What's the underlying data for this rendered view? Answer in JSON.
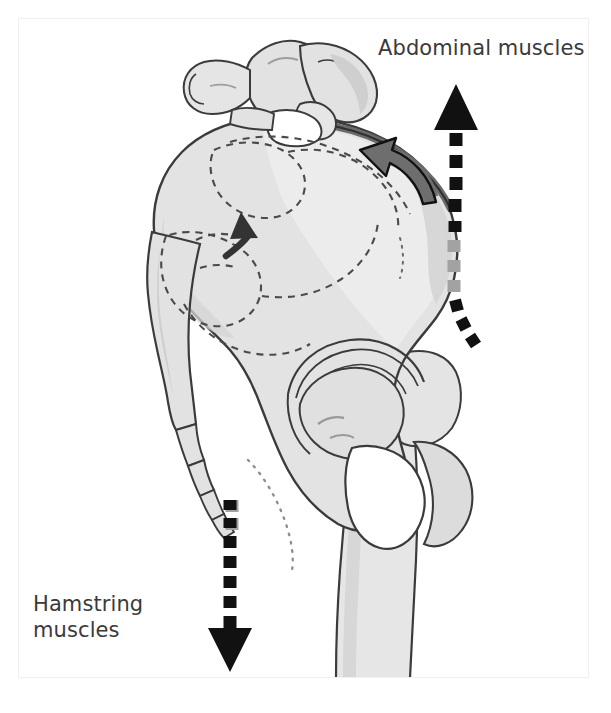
{
  "figure": {
    "background_color": "#ffffff",
    "frame_border_color": "#f0f0f0"
  },
  "labels": {
    "abdominal": "Abdominal muscles",
    "hamstring": "Hamstring\nmuscles"
  },
  "colors": {
    "text": "#3a3a3a",
    "bone_fill": "#e2e2e2",
    "bone_fill_light": "#eaeaea",
    "bone_shadow": "#cdcdcd",
    "bone_outline": "#3b3b3b",
    "dashed_outline": "#4a4a4a",
    "arrow_black": "#111111",
    "arrow_gray": "#9b9b9b",
    "curved_arrow_fill": "#6e6e6e",
    "ligament_band": "#6a6a6a",
    "white": "#ffffff"
  },
  "anatomy": {
    "parts": [
      "lumbar-vertebra",
      "sacrum",
      "coccyx",
      "ilium",
      "iliac-crest",
      "acetabulum",
      "obturator-foramen",
      "ischium",
      "pubis",
      "femoral-head",
      "greater-trochanter",
      "femur-shaft"
    ]
  },
  "arrows": {
    "abdominal_pull": {
      "name": "abdominal-muscle-force-arrow",
      "direction": "up",
      "style": "dashed",
      "head": "solid-triangle",
      "color": "#111111"
    },
    "hamstring_pull": {
      "name": "hamstring-muscle-force-arrow",
      "direction": "down",
      "style": "dashed",
      "head": "solid-triangle",
      "color": "#111111"
    },
    "pelvis_rotation_large": {
      "name": "pelvis-rotation-arrow",
      "direction": "counter-clockwise",
      "style": "solid-curved",
      "color": "#6e6e6e"
    },
    "sacral_rotation_small": {
      "name": "sacral-rotation-arrow",
      "direction": "up-right",
      "style": "solid-curved",
      "color": "#3a3a3a"
    }
  }
}
